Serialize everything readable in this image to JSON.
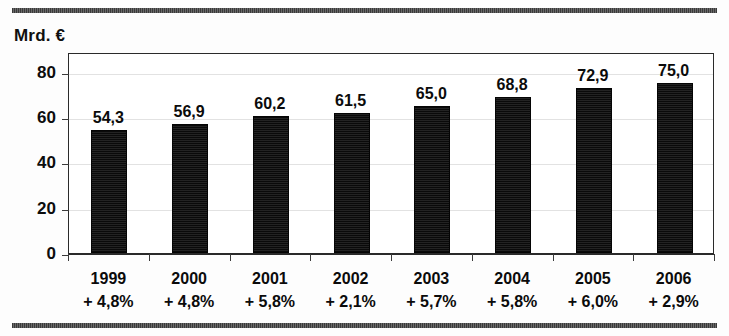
{
  "chart_data": {
    "type": "bar",
    "title": "",
    "subtitle": "",
    "xlabel": "",
    "ylabel": "Mrd. €",
    "unit_caption": "Mrd. €",
    "categories": [
      "1999",
      "2000",
      "2001",
      "2002",
      "2003",
      "2004",
      "2005",
      "2006"
    ],
    "values": [
      54.3,
      56.9,
      60.2,
      61.5,
      65.0,
      68.8,
      72.9,
      75.0
    ],
    "value_labels": [
      "54,3",
      "56,9",
      "60,2",
      "61,5",
      "65,0",
      "68,8",
      "72,9",
      "75,0"
    ],
    "annotations": [
      "+ 4,8%",
      "+ 4,8%",
      "+ 5,8%",
      "+ 2,1%",
      "+ 5,7%",
      "+ 5,8%",
      "+ 6,0%",
      "+ 2,9%"
    ],
    "annotation_role": "growth-rate-vs-previous-year",
    "ylim": [
      0,
      88.6
    ],
    "yticks": [
      0,
      20,
      40,
      60,
      80
    ],
    "ytick_labels": [
      "0",
      "20",
      "40",
      "60",
      "80"
    ],
    "grid": true,
    "grid_axis": "y",
    "legend": false,
    "legend_position": "none",
    "series": [
      {
        "name": "Mrd. €",
        "color": "#131313",
        "values": [
          54.3,
          56.9,
          60.2,
          61.5,
          65.0,
          68.8,
          72.9,
          75.0
        ]
      }
    ]
  },
  "colors": {
    "bar": "#131313",
    "frame": "#2a2a2a",
    "grid": "#e2e2e2",
    "rule": "#4a4a4a",
    "text": "#0b0b0b",
    "background": "#ffffff"
  }
}
